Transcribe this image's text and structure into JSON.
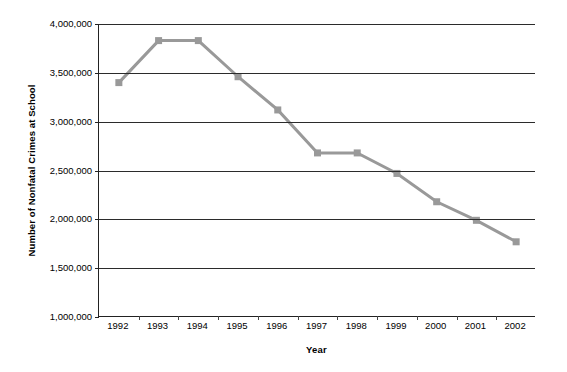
{
  "chart_data": {
    "type": "line",
    "title": "",
    "xlabel": "Year",
    "ylabel": "Number of Nonfatal Crimes at School",
    "categories": [
      "1992",
      "1993",
      "1994",
      "1995",
      "1996",
      "1997",
      "1998",
      "1999",
      "2000",
      "2001",
      "2002"
    ],
    "values": [
      3400000,
      3830000,
      3830000,
      3460000,
      3120000,
      2680000,
      2680000,
      2470000,
      2180000,
      1990000,
      1770000
    ],
    "series": [
      {
        "name": "Number of Nonfatal Crimes at School",
        "values": [
          3400000,
          3830000,
          3830000,
          3460000,
          3120000,
          2680000,
          2680000,
          2470000,
          2180000,
          1990000,
          1770000
        ]
      }
    ],
    "ylim": [
      1000000,
      4000000
    ],
    "ytick_values": [
      4000000,
      3500000,
      3000000,
      2500000,
      2000000,
      1500000,
      1000000
    ],
    "ytick_labels": [
      "4,000,000",
      "3,500,000",
      "3,000,000",
      "2,500,000",
      "2,000,000",
      "1,500,000",
      "1,000,000"
    ],
    "grid": "horizontal",
    "legend_position": "none",
    "colors": {
      "series_line": "#999999",
      "series_marker": "#999999",
      "axis": "#222222",
      "gridline": "#2b2b2b",
      "text": "#000000",
      "background": "#ffffff"
    },
    "marker_style": "square",
    "line_width": 3
  }
}
